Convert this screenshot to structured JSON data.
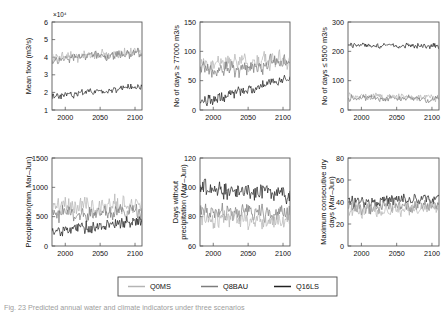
{
  "figure": {
    "caption": "Fig. 23 Predicted annual water and climate indicators under three scenarios",
    "series_colors": {
      "Q0MS": "#b4b4b4",
      "Q8BAU": "#7d7d7d",
      "Q16LS": "#222222"
    }
  },
  "legend": {
    "position": "bottom-center",
    "entries": [
      {
        "label": "Q0MS",
        "color": "#b4b4b4"
      },
      {
        "label": "Q8BAU",
        "color": "#7d7d7d"
      },
      {
        "label": "Q16LS",
        "color": "#222222"
      }
    ]
  },
  "chart_data": [
    {
      "id": "mean-flow",
      "type": "line",
      "title": "",
      "xlabel": "",
      "ylabel": "Mean flow (m3/s)",
      "y_exponent": "×10⁴",
      "xlim": [
        1981,
        2110
      ],
      "ylim": [
        1,
        6
      ],
      "xticks": [
        2000,
        2050,
        2100
      ],
      "yticks": [
        1,
        2,
        3,
        4,
        5,
        6
      ],
      "grid": false,
      "series": [
        {
          "name": "Q0MS",
          "color": "#b4b4b4",
          "baseline": 3.95,
          "trend": 0.003,
          "noise": 0.26,
          "seed": 11
        },
        {
          "name": "Q8BAU",
          "color": "#7d7d7d",
          "baseline": 3.88,
          "trend": 0.0028,
          "noise": 0.24,
          "seed": 23
        },
        {
          "name": "Q16LS",
          "color": "#222222",
          "baseline": 1.75,
          "trend": 0.0045,
          "noise": 0.17,
          "seed": 37
        }
      ]
    },
    {
      "id": "days-above-77000",
      "type": "line",
      "title": "",
      "xlabel": "",
      "ylabel": "No of days ≥ 77000 m3/s",
      "y_exponent": "",
      "xlim": [
        1981,
        2110
      ],
      "ylim": [
        0,
        150
      ],
      "xticks": [
        2000,
        2050,
        2100
      ],
      "yticks": [
        0,
        50,
        100,
        150
      ],
      "grid": false,
      "series": [
        {
          "name": "Q0MS",
          "color": "#b4b4b4",
          "baseline": 78,
          "trend": 0.07,
          "noise": 13,
          "seed": 5
        },
        {
          "name": "Q8BAU",
          "color": "#7d7d7d",
          "baseline": 66,
          "trend": 0.11,
          "noise": 12,
          "seed": 17
        },
        {
          "name": "Q16LS",
          "color": "#222222",
          "baseline": 13,
          "trend": 0.32,
          "noise": 8,
          "seed": 41
        }
      ]
    },
    {
      "id": "days-below-5500",
      "type": "line",
      "title": "",
      "xlabel": "",
      "ylabel": "No of days ≤ 5500 m3/s",
      "y_exponent": "",
      "xlim": [
        1981,
        2110
      ],
      "ylim": [
        0,
        300
      ],
      "xticks": [
        2000,
        2050,
        2100
      ],
      "yticks": [
        0,
        100,
        200,
        300
      ],
      "grid": false,
      "series": [
        {
          "name": "Q16LS",
          "color": "#222222",
          "baseline": 222,
          "trend": -0.04,
          "noise": 9,
          "seed": 7
        },
        {
          "name": "Q0MS",
          "color": "#b4b4b4",
          "baseline": 46,
          "trend": -0.03,
          "noise": 11,
          "seed": 29
        },
        {
          "name": "Q8BAU",
          "color": "#7d7d7d",
          "baseline": 41,
          "trend": -0.02,
          "noise": 10,
          "seed": 53
        }
      ]
    },
    {
      "id": "precipitation",
      "type": "line",
      "title": "",
      "xlabel": "",
      "ylabel": "Precipitation(mm, Mar–Jun)",
      "y_exponent": "",
      "xlim": [
        1981,
        2110
      ],
      "ylim": [
        0,
        1500
      ],
      "xticks": [
        2000,
        2050,
        2100
      ],
      "yticks": [
        0,
        500,
        1000,
        1500
      ],
      "grid": false,
      "series": [
        {
          "name": "Q0MS",
          "color": "#b4b4b4",
          "baseline": 650,
          "trend": 0.45,
          "noise": 135,
          "seed": 13
        },
        {
          "name": "Q8BAU",
          "color": "#7d7d7d",
          "baseline": 530,
          "trend": 0.55,
          "noise": 125,
          "seed": 31
        },
        {
          "name": "Q16LS",
          "color": "#222222",
          "baseline": 265,
          "trend": 1.3,
          "noise": 95,
          "seed": 47
        }
      ]
    },
    {
      "id": "days-without-precipitation",
      "type": "line",
      "title": "",
      "xlabel": "",
      "ylabel": "Days without precipitation (Mar–Jun)",
      "y_exponent": "",
      "xlim": [
        1981,
        2110
      ],
      "ylim": [
        60,
        120
      ],
      "xticks": [
        2000,
        2050,
        2100
      ],
      "yticks": [
        60,
        80,
        100,
        120
      ],
      "grid": false,
      "series": [
        {
          "name": "Q16LS",
          "color": "#222222",
          "baseline": 99,
          "trend": -0.035,
          "noise": 5.0,
          "seed": 19
        },
        {
          "name": "Q8BAU",
          "color": "#7d7d7d",
          "baseline": 84,
          "trend": -0.01,
          "noise": 5.2,
          "seed": 43
        },
        {
          "name": "Q0MS",
          "color": "#b4b4b4",
          "baseline": 80,
          "trend": -0.02,
          "noise": 5.6,
          "seed": 61
        }
      ]
    },
    {
      "id": "max-consecutive-dry-days",
      "type": "line",
      "title": "",
      "xlabel": "",
      "ylabel": "Maximum consecutive dry days (Mar–Jun)",
      "y_exponent": "",
      "xlim": [
        1981,
        2110
      ],
      "ylim": [
        0,
        80
      ],
      "xticks": [
        2000,
        2050,
        2100
      ],
      "yticks": [
        0,
        20,
        40,
        60,
        80
      ],
      "grid": false,
      "series": [
        {
          "name": "Q16LS",
          "color": "#222222",
          "baseline": 40,
          "trend": 0.02,
          "noise": 5.2,
          "seed": 3
        },
        {
          "name": "Q8BAU",
          "color": "#7d7d7d",
          "baseline": 34,
          "trend": 0.022,
          "noise": 5.6,
          "seed": 59
        },
        {
          "name": "Q0MS",
          "color": "#b4b4b4",
          "baseline": 32,
          "trend": 0.018,
          "noise": 6.0,
          "seed": 71
        }
      ]
    }
  ]
}
